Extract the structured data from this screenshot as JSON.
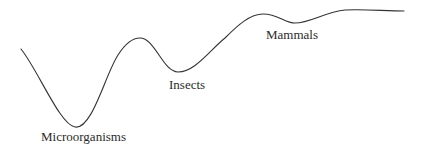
{
  "diagram": {
    "type": "fitness-landscape-curve",
    "stroke_color": "#333333",
    "background": "#ffffff",
    "curve_points": [
      [
        21,
        49
      ],
      [
        75,
        127
      ],
      [
        138,
        38
      ],
      [
        178,
        72
      ],
      [
        263,
        14
      ],
      [
        295,
        23
      ],
      [
        345,
        10
      ],
      [
        404,
        11
      ]
    ],
    "labels": {
      "microorganisms": "Microorganisms",
      "insects": "Insects",
      "mammals": "Mammals"
    }
  }
}
